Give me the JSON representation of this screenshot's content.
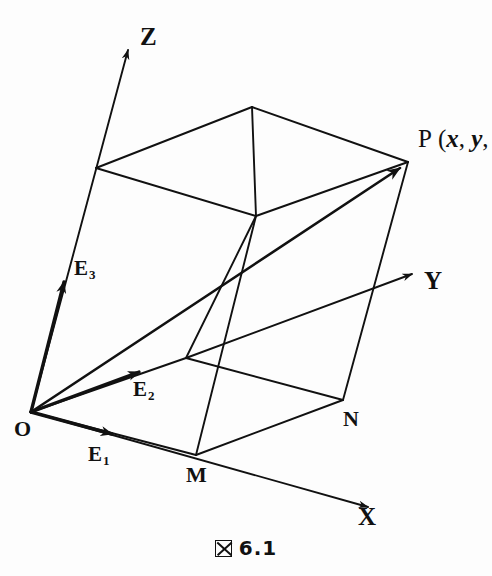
{
  "figure": {
    "caption_glyph": "box-x-glyph",
    "caption_prefix": "図",
    "caption_number": "6.1",
    "background_color": "#fdfdfd",
    "ink_color": "#111111"
  },
  "axes": [
    {
      "id": "z",
      "label": "Z",
      "from": [
        31,
        412
      ],
      "to": [
        128,
        50
      ],
      "label_pos": [
        140,
        24
      ]
    },
    {
      "id": "y",
      "label": "Y",
      "from": [
        186,
        358
      ],
      "to": [
        412,
        274
      ],
      "label_pos": [
        424,
        268
      ]
    },
    {
      "id": "x",
      "label": "X",
      "from": [
        31,
        412
      ],
      "to": [
        368,
        507
      ],
      "label_pos": [
        358,
        504
      ]
    }
  ],
  "basis_vectors": [
    {
      "id": "e1",
      "label": "E",
      "sub": "1",
      "from": [
        31,
        412
      ],
      "to": [
        112,
        434
      ],
      "label_pos": [
        88,
        444
      ]
    },
    {
      "id": "e2",
      "label": "E",
      "sub": "2",
      "from": [
        31,
        412
      ],
      "to": [
        139,
        372
      ],
      "label_pos": [
        133,
        379
      ]
    },
    {
      "id": "e3",
      "label": "E",
      "sub": "3",
      "from": [
        31,
        412
      ],
      "to": [
        64,
        282
      ],
      "label_pos": [
        74,
        258
      ]
    }
  ],
  "vertices": [
    {
      "id": "O",
      "label": "O",
      "pos": [
        31,
        412
      ],
      "label_pos": [
        14,
        418
      ]
    },
    {
      "id": "M",
      "label": "M",
      "pos": [
        196,
        455
      ],
      "label_pos": [
        186,
        464
      ]
    },
    {
      "id": "N",
      "label": "N",
      "pos": [
        343,
        400
      ],
      "label_pos": [
        343,
        408
      ]
    },
    {
      "id": "P",
      "label": "P",
      "pos": [
        408,
        162
      ],
      "label_pos": [
        418,
        128
      ]
    },
    {
      "id": "K",
      "label": "",
      "pos": [
        186,
        358
      ],
      "label_pos": [
        0,
        0
      ]
    },
    {
      "id": "A",
      "label": "",
      "pos": [
        96,
        168
      ],
      "label_pos": [
        0,
        0
      ]
    },
    {
      "id": "B",
      "label": "",
      "pos": [
        252,
        107
      ],
      "label_pos": [
        0,
        0
      ]
    },
    {
      "id": "C",
      "label": "",
      "pos": [
        256,
        216
      ],
      "label_pos": [
        0,
        0
      ]
    }
  ],
  "point_label": {
    "name": "P",
    "open_paren": "(",
    "coord_x": "x",
    "comma1": ", ",
    "coord_y": "y",
    "comma2": ","
  },
  "edges": [
    {
      "id": "O-M",
      "from": [
        31,
        412
      ],
      "to": [
        196,
        455
      ]
    },
    {
      "id": "M-N",
      "from": [
        196,
        455
      ],
      "to": [
        343,
        400
      ]
    },
    {
      "id": "O-K",
      "from": [
        31,
        412
      ],
      "to": [
        186,
        358
      ]
    },
    {
      "id": "K-N",
      "from": [
        186,
        358
      ],
      "to": [
        343,
        400
      ]
    },
    {
      "id": "M-C",
      "from": [
        196,
        455
      ],
      "to": [
        256,
        216
      ]
    },
    {
      "id": "N-P",
      "from": [
        343,
        400
      ],
      "to": [
        408,
        162
      ]
    },
    {
      "id": "K-C",
      "from": [
        186,
        358
      ],
      "to": [
        256,
        216
      ]
    },
    {
      "id": "A-B",
      "from": [
        96,
        168
      ],
      "to": [
        252,
        107
      ]
    },
    {
      "id": "A-C",
      "from": [
        96,
        168
      ],
      "to": [
        256,
        216
      ]
    },
    {
      "id": "B-P",
      "from": [
        252,
        107
      ],
      "to": [
        408,
        162
      ]
    },
    {
      "id": "C-P",
      "from": [
        256,
        216
      ],
      "to": [
        408,
        162
      ]
    },
    {
      "id": "B-C",
      "from": [
        252,
        107
      ],
      "to": [
        256,
        216
      ]
    }
  ],
  "ray_OP": {
    "id": "O-P",
    "from": [
      31,
      412
    ],
    "to": [
      406,
      164
    ]
  },
  "style": {
    "line_width": 1.9,
    "axis_line_width": 1.9,
    "basis_line_width": 3.4
  }
}
